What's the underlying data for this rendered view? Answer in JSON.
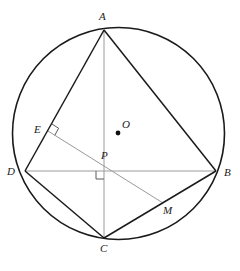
{
  "figure": {
    "background_color": "#ffffff",
    "stroke_dark": "#1a1a1a",
    "stroke_gray": "#9a9a9a",
    "circle": {
      "name": "circumscribed-circle",
      "cx": 118.5,
      "cy": 133.5,
      "r": 106.0,
      "stroke": "#1a1a1a",
      "stroke_width": 1.6
    },
    "points": {
      "A": {
        "label": "A",
        "x": 104,
        "y": 30,
        "label_x": 99,
        "label_y": 11
      },
      "B": {
        "label": "B",
        "x": 216,
        "y": 171,
        "label_x": 224,
        "label_y": 167
      },
      "C": {
        "label": "C",
        "x": 104,
        "y": 238,
        "label_x": 100,
        "label_y": 243
      },
      "D": {
        "label": "D",
        "x": 25,
        "y": 171,
        "label_x": 7,
        "label_y": 166
      },
      "E": {
        "label": "E",
        "x": 48,
        "y": 131,
        "label_x": 34,
        "label_y": 124
      },
      "M": {
        "label": "M",
        "x": 163,
        "y": 203,
        "label_x": 163,
        "label_y": 205
      },
      "O": {
        "label": "O",
        "x": 118,
        "y": 133,
        "label_x": 122,
        "label_y": 119
      },
      "P": {
        "label": "P",
        "x": 104,
        "y": 171,
        "label_x": 101,
        "label_y": 150
      }
    },
    "segments": [
      {
        "name": "segment-AD",
        "from": "A",
        "to": "D",
        "style": "dark"
      },
      {
        "name": "segment-AB",
        "from": "A",
        "to": "B",
        "style": "dark"
      },
      {
        "name": "segment-DC",
        "from": "D",
        "to": "C",
        "style": "dark"
      },
      {
        "name": "segment-CB",
        "from": "C",
        "to": "B",
        "style": "dark"
      },
      {
        "name": "diagonal-AC",
        "from": "A",
        "to": "C",
        "style": "gray"
      },
      {
        "name": "diagonal-DB",
        "from": "D",
        "to": "B",
        "style": "gray"
      },
      {
        "name": "segment-EM",
        "from": "E",
        "to": "M",
        "style": "gray"
      }
    ],
    "right_angles": [
      {
        "name": "right-angle-at-E",
        "at": "E"
      },
      {
        "name": "right-angle-at-P",
        "at": "P"
      }
    ],
    "center_dot": {
      "name": "center-point-O",
      "x": 118,
      "y": 133,
      "r": 2.4
    }
  }
}
